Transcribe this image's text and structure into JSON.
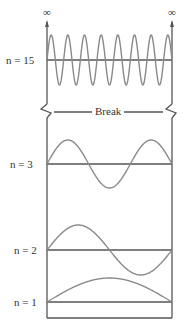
{
  "figure": {
    "infinity_symbol": "∞",
    "break_label": "Break",
    "modes": [
      {
        "label": "n = 15",
        "n": 15
      },
      {
        "label": "n = 3",
        "n": 3
      },
      {
        "label": "n = 2",
        "n": 2
      },
      {
        "label": "n = 1",
        "n": 1
      }
    ]
  },
  "colors": {
    "axis": "#555555",
    "wave": "#8a8a8a"
  }
}
